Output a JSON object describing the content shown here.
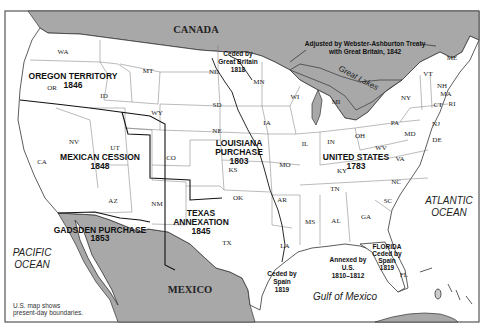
{
  "countries": {
    "canada": "CANADA",
    "mexico": "MEXICO"
  },
  "water": {
    "pacific_line1": "PACIFIC",
    "pacific_line2": "OCEAN",
    "atlantic_line1": "ATLANTIC",
    "atlantic_line2": "OCEAN",
    "gulf": "Gulf of Mexico",
    "great_lakes": "Great Lakes"
  },
  "regions": {
    "oregon": {
      "name": "OREGON TERRITORY",
      "year": "1846"
    },
    "mexican_cession": {
      "name": "MEXICAN CESSION",
      "year": "1848"
    },
    "louisiana": {
      "name1": "LOUISIANA",
      "name2": "PURCHASE",
      "year": "1803"
    },
    "united_states": {
      "name": "UNITED STATES",
      "year": "1783"
    },
    "texas": {
      "name1": "TEXAS",
      "name2": "ANNEXATION",
      "year": "1845"
    },
    "gadsden": {
      "name": "GADSDEN PURCHASE",
      "year": "1853"
    }
  },
  "annotations": {
    "ceded_gb_1": "Ceded by",
    "ceded_gb_2": "Great Britain",
    "ceded_gb_3": "1818",
    "webster_1": "Adjusted by Webster-Ashburton Treaty",
    "webster_2": "with Great Britain, 1842",
    "ceded_spain_1": "Ceded by",
    "ceded_spain_2": "Spain",
    "ceded_spain_3": "1819",
    "annexed_1": "Annexed by",
    "annexed_2": "U.S.",
    "annexed_3": "1810–1812",
    "florida_1": "FLORIDA",
    "florida_2": "Ceded by",
    "florida_3": "Spain",
    "florida_4": "1819"
  },
  "states": {
    "WA": "WA",
    "OR": "OR",
    "ID": "ID",
    "MT": "MT",
    "WY": "WY",
    "ND": "ND",
    "SD": "SD",
    "NE": "NE",
    "MN": "MN",
    "IA": "IA",
    "WI": "WI",
    "MI": "MI",
    "IL": "IL",
    "IN": "IN",
    "OH": "OH",
    "NY": "NY",
    "PA": "PA",
    "VT": "VT",
    "NH": "NH",
    "ME": "ME",
    "MA": "MA",
    "CT": "CT",
    "RI": "RI",
    "NJ": "NJ",
    "DE": "DE",
    "MD": "MD",
    "WV": "WV",
    "VA": "VA",
    "KY": "KY",
    "TN": "TN",
    "NC": "NC",
    "SC": "SC",
    "GA": "GA",
    "AL": "AL",
    "MS": "MS",
    "LA": "LA",
    "FL": "FL",
    "AR": "AR",
    "MO": "MO",
    "KS": "KS",
    "OK": "OK",
    "TX": "TX",
    "CO": "CO",
    "NM": "NM",
    "AZ": "AZ",
    "UT": "UT",
    "NV": "NV",
    "CA": "CA"
  },
  "caption": {
    "line1": "U.S. map shows",
    "line2": "present-day boundaries."
  }
}
